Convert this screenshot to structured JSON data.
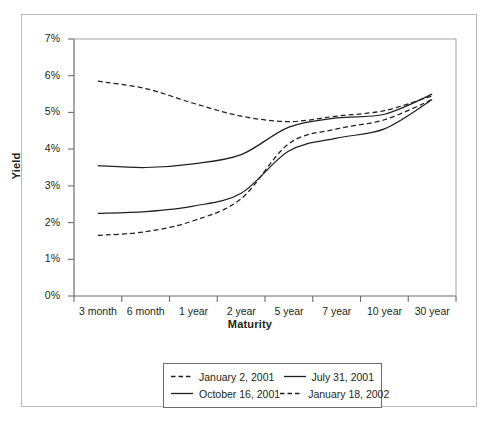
{
  "chart_data": {
    "type": "line",
    "title": "",
    "xlabel": "Maturity",
    "ylabel": "Yield",
    "categories": [
      "3 month",
      "6 month",
      "1 year",
      "2 year",
      "5 year",
      "7 year",
      "10 year",
      "30 year"
    ],
    "ylim": [
      0,
      7
    ],
    "ytick_labels": [
      "0%",
      "1%",
      "2%",
      "3%",
      "4%",
      "5%",
      "6%",
      "7%"
    ],
    "ytick_values": [
      0,
      1,
      2,
      3,
      4,
      5,
      6,
      7
    ],
    "grid": false,
    "legend_position": "below-plot",
    "series": [
      {
        "name": "January 2, 2001",
        "style": "dashed",
        "color": "#231f20",
        "values": [
          5.85,
          5.65,
          5.25,
          4.9,
          4.75,
          4.9,
          5.05,
          5.45
        ]
      },
      {
        "name": "July 31, 2001",
        "style": "solid",
        "color": "#231f20",
        "values": [
          3.55,
          3.5,
          3.6,
          3.85,
          4.6,
          4.85,
          4.95,
          5.5
        ]
      },
      {
        "name": "October 16, 2001",
        "style": "solid",
        "color": "#231f20",
        "values": [
          2.25,
          2.3,
          2.45,
          2.8,
          3.95,
          4.3,
          4.55,
          5.35
        ]
      },
      {
        "name": "January 18, 2002",
        "style": "dashed",
        "color": "#231f20",
        "values": [
          1.65,
          1.75,
          2.05,
          2.65,
          4.15,
          4.55,
          4.8,
          5.35
        ]
      }
    ]
  },
  "axes": {
    "y_title": "Yield",
    "x_title": "Maturity"
  },
  "legend": {
    "entries": [
      {
        "label": "January 2, 2001",
        "style": "dashed"
      },
      {
        "label": "July 31, 2001",
        "style": "solid"
      },
      {
        "label": "October 16, 2001",
        "style": "solid"
      },
      {
        "label": "January 18, 2002",
        "style": "dashed"
      }
    ]
  },
  "colors": {
    "line": "#231f20",
    "axis": "#6d6d6d",
    "frame": "#b9b9b9",
    "background": "#ffffff"
  }
}
